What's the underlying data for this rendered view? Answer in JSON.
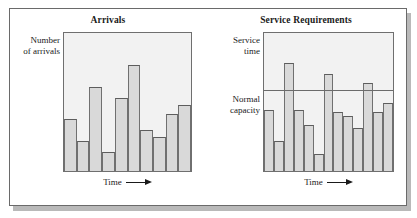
{
  "figure": {
    "panels": [
      {
        "id": "arrivals",
        "title": "Arrivals",
        "y_axis_label": "Number\nof arrivals",
        "x_axis_label": "Time",
        "x_axis_arrow": "right-arrow"
      },
      {
        "id": "service-requirements",
        "title": "Service Requirements",
        "y_axis_label": "Service\ntime",
        "capacity_label": "Normal\ncapacity",
        "x_axis_label": "Time",
        "x_axis_arrow": "right-arrow"
      }
    ]
  },
  "colors": {
    "bar_fill": "#d9d9d9",
    "bar_outline": "#707070",
    "plot_background": "#f2f2f2",
    "frame_border": "#6a6a6a",
    "shadow": "#b9b9b9",
    "text": "#1a1a1a"
  },
  "chart_data": [
    {
      "type": "bar",
      "id": "arrivals",
      "title": "Arrivals",
      "xlabel": "Time",
      "ylabel": "Number of arrivals",
      "grid": false,
      "legend": "none",
      "axis_ticks": "none",
      "ylim": [
        0,
        100
      ],
      "categories": [
        "1",
        "2",
        "3",
        "4",
        "5",
        "6",
        "7",
        "8",
        "9"
      ],
      "values": [
        38,
        22,
        61,
        14,
        53,
        77,
        30,
        25,
        41,
        48
      ],
      "series": [
        {
          "name": "Arrivals per period",
          "values": [
            38,
            22,
            61,
            14,
            53,
            77,
            30,
            25,
            41,
            48
          ]
        }
      ]
    },
    {
      "type": "bar",
      "id": "service-requirements",
      "title": "Service Requirements",
      "xlabel": "Time",
      "ylabel": "Service time",
      "grid": false,
      "legend": "none",
      "axis_ticks": "none",
      "ylim": [
        0,
        100
      ],
      "reference_line": {
        "label": "Normal capacity",
        "value": 58,
        "orientation": "horizontal"
      },
      "categories": [
        "1",
        "2",
        "3",
        "4",
        "5",
        "6",
        "7",
        "8",
        "9",
        "10",
        "11"
      ],
      "values": [
        44,
        22,
        78,
        44,
        33,
        12,
        70,
        43,
        40,
        31,
        64,
        43,
        49
      ],
      "series": [
        {
          "name": "Service time required",
          "values": [
            44,
            22,
            78,
            44,
            33,
            12,
            70,
            43,
            40,
            31,
            64,
            43,
            49
          ]
        }
      ]
    }
  ]
}
